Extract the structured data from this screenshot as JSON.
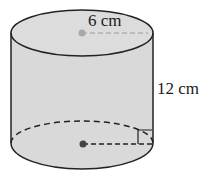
{
  "figure": {
    "shape": "cylinder",
    "labels": {
      "radius": "6 cm",
      "height": "12 cm"
    },
    "colors": {
      "fill": "#d9d9d9",
      "stroke": "#222222",
      "center_dot": "#444444",
      "top_dot": "#9a9a9a"
    }
  }
}
